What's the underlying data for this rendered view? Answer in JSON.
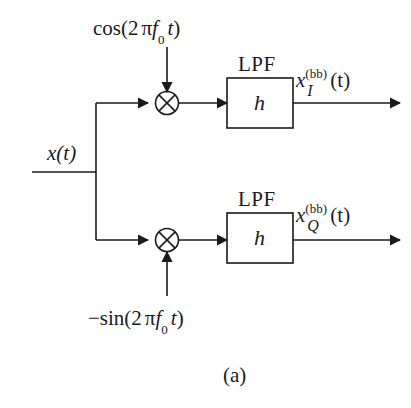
{
  "figure": {
    "caption": "(a)",
    "background_color": "#ffffff",
    "line_color": "#1a1a1a"
  },
  "input": {
    "signal_label_x": "x",
    "signal_label_arg": "(t)"
  },
  "oscillators": {
    "top": {
      "prefix": "cos(2",
      "pi": "π",
      "freq": "f",
      "freq_sub": "0",
      "time": "t",
      "suffix": ")",
      "full_text": "cos(2 πf0 t)",
      "arrow_direction": "down"
    },
    "bottom": {
      "prefix": "−sin(2",
      "pi": "π",
      "freq": "f",
      "freq_sub": "0",
      "time": "t",
      "suffix": ")",
      "full_text": "−sin(2 πf0 t)",
      "arrow_direction": "up"
    }
  },
  "mixers": [
    {
      "name": "mixer-i",
      "symbol": "⊗"
    },
    {
      "name": "mixer-q",
      "symbol": "⊗"
    }
  ],
  "filters": [
    {
      "name": "lpf-i",
      "title": "LPF",
      "impulse_response": "h"
    },
    {
      "name": "lpf-q",
      "title": "LPF",
      "impulse_response": "h"
    }
  ],
  "outputs": [
    {
      "name": "output-i",
      "base": "x",
      "superscript": "(bb)",
      "subscript": "I",
      "arg": "(t)",
      "full_text": "x^(bb)_I(t)"
    },
    {
      "name": "output-q",
      "base": "x",
      "superscript": "(bb)",
      "subscript": "Q",
      "arg": "(t)",
      "full_text": "x^(bb)_Q(t)"
    }
  ]
}
